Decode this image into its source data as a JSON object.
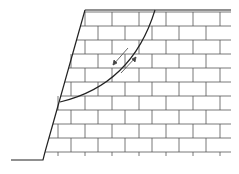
{
  "diagram": {
    "type": "slope-slip-surface",
    "colors": {
      "outline": "#222222",
      "grid": "#555555",
      "arrow": "#444444",
      "background": "#ffffff"
    },
    "geometry": {
      "top_y": 10,
      "top_left_x": 85,
      "top_right_x": 231,
      "toe_x": 45,
      "toe_y": 152,
      "ground_left_x": 11,
      "ground_y": 160,
      "row_ys": [
        12,
        26,
        40,
        54,
        68,
        82,
        96,
        110,
        124,
        138,
        152
      ],
      "brick_width": 27
    },
    "caption": ""
  }
}
